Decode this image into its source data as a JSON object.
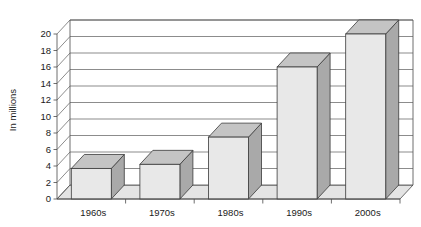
{
  "chart_data": {
    "type": "bar",
    "title": "",
    "subtitle": "",
    "xlabel": "",
    "ylabel": "In millions",
    "categories": [
      "1960s",
      "1970s",
      "1980s",
      "1990s",
      "2000s"
    ],
    "values": [
      3.7,
      4.2,
      7.5,
      16.0,
      20.0
    ],
    "series": [
      {
        "name": "In millions",
        "values": [
          3.7,
          4.2,
          7.5,
          16.0,
          20.0
        ]
      }
    ],
    "ylim": [
      0,
      20
    ],
    "ytick_labels": [
      "0",
      "2",
      "4",
      "6",
      "8",
      "10",
      "12",
      "14",
      "16",
      "18",
      "20"
    ],
    "ytick_values": [
      0,
      2,
      4,
      6,
      8,
      10,
      12,
      14,
      16,
      18,
      20
    ],
    "grid": true,
    "grid_axis": "y",
    "legend": false,
    "legend_position": "none",
    "style": "3d-column",
    "colors": {
      "bar_front": "#e8e8e8",
      "bar_side": "#a9a9a9",
      "bar_top": "#c4c4c4",
      "floor": "#e4e4e4",
      "wall": "#ffffff",
      "line": "#4a4a4a",
      "text": "#1a1a1a"
    }
  },
  "axes": {
    "y_title": "In millions"
  }
}
